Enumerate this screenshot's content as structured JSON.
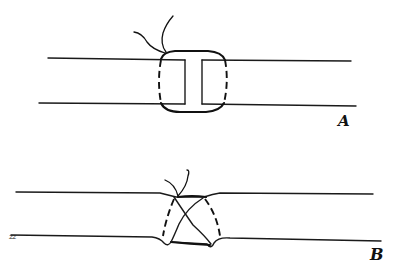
{
  "figure": {
    "panels": [
      {
        "id": "A",
        "label": "A",
        "description": "Two parallel tube walls (vessel ends) with an I-shaped gap, joined by a circumferential suture loop; solid arcs above and below, dashed lines indicate the suture passing behind; thread ends tied at top."
      },
      {
        "id": "B",
        "label": "B",
        "description": "Same vessel after tightening: ends drawn together, walls dimpled inward, crossing suture strands with dashed back portions, knot at top."
      }
    ],
    "side_mark": "zz"
  }
}
